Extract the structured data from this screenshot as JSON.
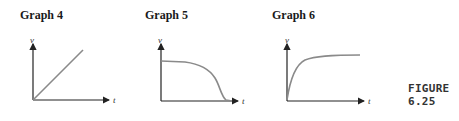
{
  "graphs": [
    {
      "title": "Graph 4",
      "y_label": "v",
      "x_label": "t",
      "shape": "linear increasing from origin"
    },
    {
      "title": "Graph 5",
      "y_label": "v",
      "x_label": "t",
      "shape": "constant then sharp drop to zero"
    },
    {
      "title": "Graph 6",
      "y_label": "v",
      "x_label": "t",
      "shape": "rapid rise from origin then plateau"
    }
  ],
  "figure_label": "FIGURE 6.25",
  "colors": {
    "axis": "#222222",
    "curve": "#8a8a8a"
  }
}
